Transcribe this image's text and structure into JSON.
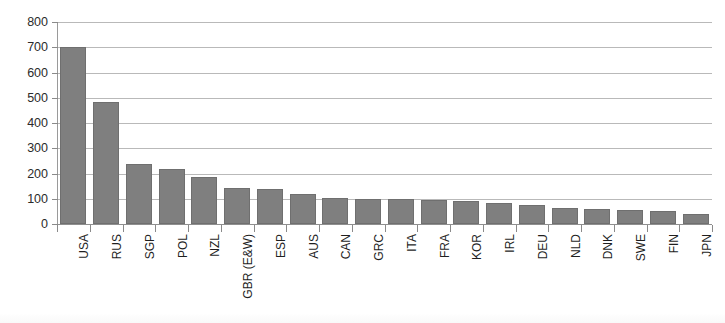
{
  "chart_data": {
    "type": "bar",
    "title": "",
    "subtitle": "",
    "xlabel": "",
    "ylabel": "",
    "ylim": [
      0,
      800
    ],
    "yticks": [
      0,
      100,
      200,
      300,
      400,
      500,
      600,
      700,
      800
    ],
    "ytick_labels": [
      "0",
      "100",
      "200",
      "300",
      "400",
      "500",
      "600",
      "700",
      "800"
    ],
    "grid": "horizontal",
    "legend": "none",
    "orientation": "vertical",
    "label_rotation": 90,
    "bar_color": "#7f7f7f",
    "gridline_color": "#b9b9b9",
    "axis_color": "#8a8a8a",
    "background": "#ffffff",
    "categories": [
      "USA",
      "RUS",
      "SGP",
      "POL",
      "NZL",
      "GBR (E&W)",
      "ESP",
      "AUS",
      "CAN",
      "GRC",
      "ITA",
      "FRA",
      "KOR",
      "IRL",
      "DEU",
      "NLD",
      "DNK",
      "SWE",
      "FIN",
      "JPN"
    ],
    "values": [
      700,
      485,
      238,
      217,
      185,
      143,
      137,
      117,
      105,
      100,
      98,
      95,
      92,
      83,
      75,
      63,
      58,
      55,
      50,
      40
    ]
  }
}
